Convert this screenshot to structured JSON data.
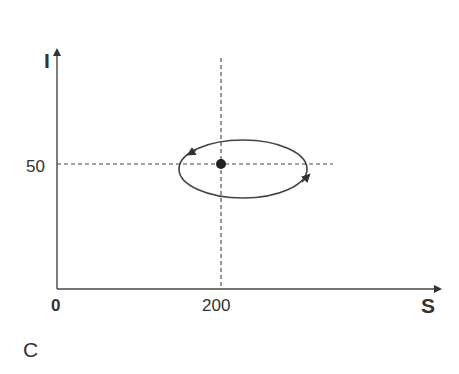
{
  "diagram": {
    "y_axis_label": "I",
    "x_axis_label": "S",
    "origin_label": "0",
    "y_tick_label": "50",
    "x_tick_label": "200",
    "panel_label": "C",
    "equilibrium": {
      "S": 200,
      "I": 50
    },
    "orbit_direction": "counterclockwise",
    "colors": {
      "ink": "#333333",
      "background": "#ffffff"
    }
  }
}
